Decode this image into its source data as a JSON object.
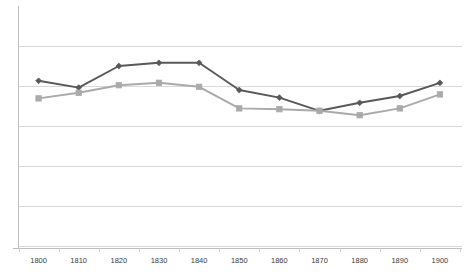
{
  "chart_data": {
    "type": "line",
    "title": "",
    "subtitle": "",
    "xlabel": "",
    "ylabel": "",
    "categories": [
      "1800",
      "1810",
      "1820",
      "1830",
      "1840",
      "1850",
      "1860",
      "1870",
      "1880",
      "1890",
      "1900"
    ],
    "x": [
      1800,
      1810,
      1820,
      1830,
      1840,
      1850,
      1860,
      1870,
      1880,
      1890,
      1900
    ],
    "xlim": [
      1795,
      1905
    ],
    "ylim": [
      0,
      6
    ],
    "y_gridlines": [
      0,
      1,
      2,
      3,
      4,
      5
    ],
    "y_axis_labels_visible": false,
    "grid": "horizontal",
    "legend": "none",
    "series": [
      {
        "name": "series-1",
        "color": "#595959",
        "marker": "diamond",
        "values": [
          4.13,
          3.96,
          4.5,
          4.58,
          4.58,
          3.9,
          3.71,
          3.38,
          3.58,
          3.75,
          4.08
        ]
      },
      {
        "name": "series-2",
        "color": "#aaaaaa",
        "marker": "square",
        "values": [
          3.69,
          3.83,
          4.02,
          4.08,
          3.98,
          3.44,
          3.42,
          3.38,
          3.27,
          3.44,
          3.79
        ]
      }
    ]
  },
  "axis": {
    "tick_labels": [
      "1800",
      "1810",
      "1820",
      "1830",
      "1840",
      "1850",
      "1860",
      "1870",
      "1880",
      "1890",
      "1900"
    ]
  },
  "colors": {
    "series_1": "#595959",
    "series_2": "#aaaaaa",
    "gridline": "#d9d9d9",
    "axis_line": "#bfbfbf",
    "background": "#ffffff",
    "tick_text": "#3a3a3a"
  }
}
